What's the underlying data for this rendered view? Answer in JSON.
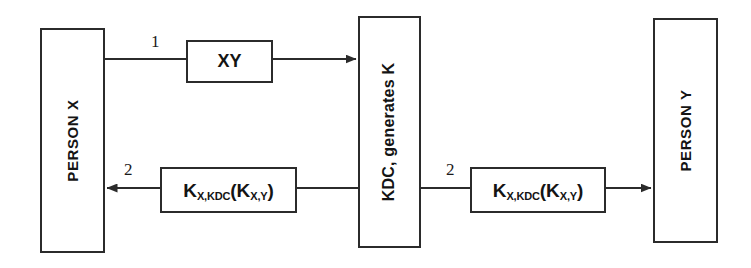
{
  "diagram": {
    "background_color": "#ffffff",
    "stroke_color": "#2b2b2b",
    "text_color": "#141414"
  },
  "actors": {
    "person_x": {
      "label": "PERSON X",
      "orientation": "vertical-bottom-to-top"
    },
    "kdc": {
      "label": "KDC, generates K",
      "orientation": "vertical-bottom-to-top"
    },
    "person_y": {
      "label": "PERSON Y",
      "orientation": "vertical-bottom-to-top"
    }
  },
  "messages": {
    "request": {
      "step": "1",
      "payload_main": "XY",
      "payload_sub1": "",
      "payload_sub2": ""
    },
    "reply_to_x": {
      "step": "2",
      "key_main": "K",
      "key_sub": "X,KDC",
      "open_paren": "(",
      "inner_main": "K",
      "inner_sub": "X,Y",
      "close_paren": ")"
    },
    "reply_to_y": {
      "step": "2",
      "key_main": "K",
      "key_sub": "X,KDC",
      "open_paren": "(",
      "inner_main": "K",
      "inner_sub": "X,Y",
      "close_paren": ")"
    }
  }
}
